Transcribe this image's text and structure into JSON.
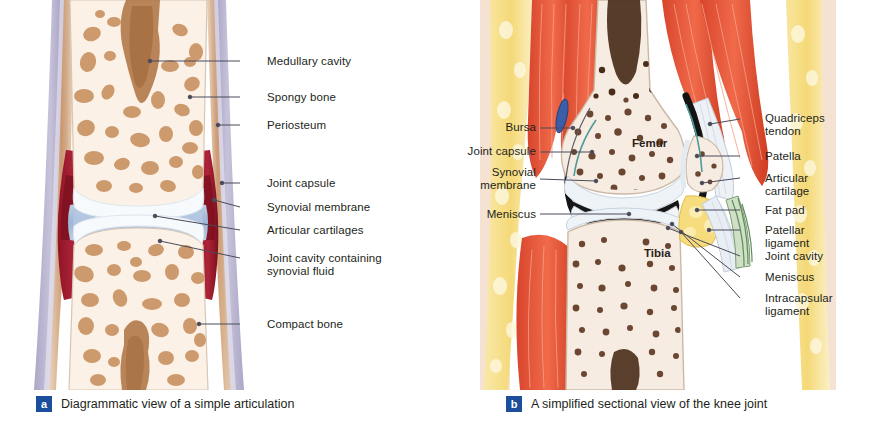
{
  "figure": {
    "background_color": "#ffffff",
    "text_color": "#231f20",
    "leader_line_color": "#4a4a5a",
    "badge_color": "#1b4f9c"
  },
  "panel_a": {
    "id": "a",
    "caption": "Diagrammatic view of a simple articulation",
    "labels": [
      {
        "text": "Medullary cavity",
        "x": 267,
        "y": 55,
        "line_x1": 240,
        "line_y1": 61,
        "line_x2": 150,
        "line_y2": 61,
        "dot_x": 150,
        "dot_y": 61
      },
      {
        "text": "Spongy bone",
        "x": 267,
        "y": 91,
        "line_x1": 240,
        "line_y1": 97,
        "line_x2": 190,
        "line_y2": 97,
        "dot_x": 190,
        "dot_y": 97
      },
      {
        "text": "Periosteum",
        "x": 267,
        "y": 119,
        "line_x1": 240,
        "line_y1": 125,
        "line_x2": 218,
        "line_y2": 125,
        "dot_x": 218,
        "dot_y": 125
      },
      {
        "text": "Joint capsule",
        "x": 267,
        "y": 177,
        "line_x1": 240,
        "line_y1": 183,
        "line_x2": 222,
        "line_y2": 183,
        "dot_x": 222,
        "dot_y": 183
      },
      {
        "text": "Synovial membrane",
        "x": 267,
        "y": 201,
        "line_x1": 240,
        "line_y1": 207,
        "line_x2": 214,
        "line_y2": 200,
        "dot_x": 214,
        "dot_y": 200
      },
      {
        "text": "Articular cartilages",
        "x": 267,
        "y": 224,
        "line_x1": 240,
        "line_y1": 230,
        "line_x2": 155,
        "line_y2": 216,
        "dot_x": 155,
        "dot_y": 216
      },
      {
        "text": "Joint cavity containing\nsynovial fluid",
        "x": 267,
        "y": 252,
        "line_x1": 240,
        "line_y1": 258,
        "line_x2": 160,
        "line_y2": 241,
        "dot_x": 160,
        "dot_y": 241
      },
      {
        "text": "Compact bone",
        "x": 267,
        "y": 318,
        "line_x1": 240,
        "line_y1": 324,
        "line_x2": 199,
        "line_y2": 324,
        "dot_x": 199,
        "dot_y": 324
      }
    ],
    "colors": {
      "bone_fill": "#fbf1e7",
      "bone_outline": "#d9c6b2",
      "trabecula": "#cd9a6e",
      "marrow": "#b07848",
      "periosteum_outer": "#a7a3c4",
      "periosteum_inner": "#c9804f",
      "joint_capsule": "#9e1f32",
      "synovial_membrane": "#c7415a",
      "joint_cavity": "#aec4e0",
      "cartilage": "#f4f7fb"
    }
  },
  "panel_b": {
    "id": "b",
    "caption": "A simplified sectional view of the knee joint",
    "bone_names": [
      {
        "text": "Femur",
        "x": 632,
        "y": 143
      },
      {
        "text": "Tibia",
        "x": 644,
        "y": 253
      }
    ],
    "labels_left": [
      {
        "text": "Bursa",
        "x": 496,
        "y": 121,
        "align": "right",
        "line_x1": 540,
        "line_y1": 128,
        "line_x2": 573,
        "line_y2": 128,
        "dot_x": 573,
        "dot_y": 128
      },
      {
        "text": "Joint capsule",
        "x": 457,
        "y": 145,
        "align": "right",
        "line_x1": 540,
        "line_y1": 152,
        "line_x2": 592,
        "line_y2": 152,
        "dot_x": 592,
        "dot_y": 152
      },
      {
        "text": "Synovial\nmembrane",
        "x": 478,
        "y": 172,
        "align": "right",
        "line_x1": 540,
        "line_y1": 179,
        "line_x2": 596,
        "line_y2": 181,
        "dot_x": 596,
        "dot_y": 181
      },
      {
        "text": "Meniscus",
        "x": 480,
        "y": 208,
        "align": "right",
        "line_x1": 540,
        "line_y1": 214,
        "line_x2": 629,
        "line_y2": 214,
        "dot_x": 629,
        "dot_y": 214
      }
    ],
    "labels_right": [
      {
        "text": "Quadriceps\ntendon",
        "x": 765,
        "y": 112,
        "line_x1": 740,
        "line_y1": 119,
        "line_x2": 710,
        "line_y2": 124,
        "dot_x": 710,
        "dot_y": 124
      },
      {
        "text": "Patella",
        "x": 765,
        "y": 150,
        "line_x1": 740,
        "line_y1": 156,
        "line_x2": 697,
        "line_y2": 156,
        "dot_x": 697,
        "dot_y": 156
      },
      {
        "text": "Articular\ncartilage",
        "x": 765,
        "y": 172,
        "line_x1": 740,
        "line_y1": 178,
        "line_x2": 702,
        "line_y2": 183,
        "dot_x": 702,
        "dot_y": 183
      },
      {
        "text": "Fat pad",
        "x": 765,
        "y": 204,
        "line_x1": 740,
        "line_y1": 210,
        "line_x2": 697,
        "line_y2": 210,
        "dot_x": 697,
        "dot_y": 210
      },
      {
        "text": "Patellar\nligament",
        "x": 765,
        "y": 224,
        "line_x1": 740,
        "line_y1": 230,
        "line_x2": 709,
        "line_y2": 230,
        "dot_x": 709,
        "dot_y": 230
      },
      {
        "text": "Joint cavity",
        "x": 765,
        "y": 250,
        "line_x1": 740,
        "line_y1": 256,
        "line_x2": 668,
        "line_y2": 228,
        "dot_x": 668,
        "dot_y": 228
      },
      {
        "text": "Meniscus",
        "x": 765,
        "y": 271,
        "line_x1": 740,
        "line_y1": 277,
        "line_x2": 672,
        "line_y2": 224,
        "dot_x": 672,
        "dot_y": 224
      },
      {
        "text": "Intracapsular\nligament",
        "x": 765,
        "y": 292,
        "line_x1": 740,
        "line_y1": 298,
        "line_x2": 681,
        "line_y2": 232,
        "dot_x": 681,
        "dot_y": 232
      }
    ],
    "colors": {
      "muscle": "#e8503a",
      "muscle_dark": "#c93a26",
      "fat": "#f7e08a",
      "fat_light": "#fbf1c2",
      "bone_fill": "#f6ece2",
      "bone_outline": "#cbb9a6",
      "trabecula": "#6b4630",
      "marrow": "#4a2c1a",
      "cartilage": "#e8eef5",
      "capsule_dark": "#1a1a1a",
      "bursa": "#3a5fa8",
      "ligament": "#5f8c5a",
      "skin": "#f0c9b0"
    }
  }
}
